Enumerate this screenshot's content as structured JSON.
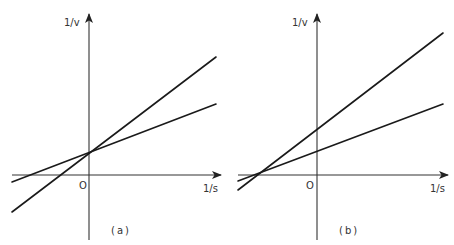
{
  "panels": [
    {
      "caption": "(a)",
      "y_axis_label": "1/v",
      "x_axis_label": "1/s",
      "origin_label": "O",
      "description": "Two lines intersecting on the 1/v axis with different slopes (competitive inhibition pattern)",
      "lines": [
        {
          "name": "steeper",
          "y_intercept": "same",
          "x_intercept": "closer to origin"
        },
        {
          "name": "shallower",
          "y_intercept": "same",
          "x_intercept": "further from origin"
        }
      ]
    },
    {
      "caption": "(b)",
      "y_axis_label": "1/v",
      "x_axis_label": "1/s",
      "origin_label": "O",
      "description": "Two lines intersecting on the 1/s axis with different 1/v intercepts (non-competitive inhibition pattern)",
      "lines": [
        {
          "name": "steeper",
          "y_intercept": "higher",
          "x_intercept": "same"
        },
        {
          "name": "shallower",
          "y_intercept": "lower",
          "x_intercept": "same"
        }
      ]
    }
  ],
  "colors": {
    "line": "#1a1a1a",
    "axis": "#333333",
    "background": "#ffffff"
  }
}
